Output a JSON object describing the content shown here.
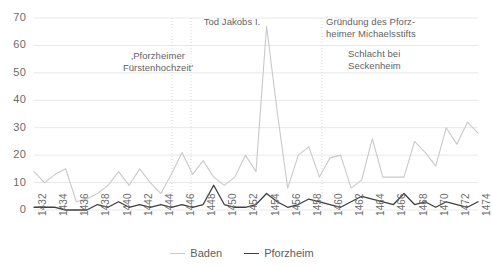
{
  "chart_data": {
    "type": "line",
    "title": "",
    "xlabel": "",
    "ylabel": "",
    "ylim": [
      0,
      70
    ],
    "y_ticks": [
      0,
      10,
      20,
      30,
      40,
      50,
      60,
      70
    ],
    "grid": "horizontal",
    "legend_position": "bottom",
    "x": [
      1432,
      1433,
      1434,
      1435,
      1436,
      1437,
      1438,
      1439,
      1440,
      1441,
      1442,
      1443,
      1444,
      1445,
      1446,
      1447,
      1448,
      1449,
      1450,
      1451,
      1452,
      1453,
      1454,
      1455,
      1456,
      1457,
      1458,
      1459,
      1460,
      1461,
      1462,
      1463,
      1464,
      1465,
      1466,
      1467,
      1468,
      1469,
      1470,
      1471,
      1472,
      1473,
      1474
    ],
    "x_tick_labels": [
      "1432",
      "1434",
      "1436",
      "1438",
      "1440",
      "1442",
      "1444",
      "1446",
      "1448",
      "1450",
      "1452",
      "1454",
      "1456",
      "1458",
      "1460",
      "1462",
      "1464",
      "1466",
      "1468",
      "1470",
      "1472",
      "1474"
    ],
    "series": [
      {
        "name": "Baden",
        "color": "#c9c9c9",
        "values": [
          14,
          10,
          13,
          15,
          3,
          4,
          6,
          9,
          14,
          9,
          15,
          10,
          6,
          13,
          21,
          13,
          18,
          12,
          9,
          12,
          20,
          14,
          67,
          36,
          8,
          20,
          23,
          12,
          19,
          20,
          8,
          11,
          26,
          12,
          12,
          12,
          25,
          21,
          16,
          30,
          24,
          32,
          28
        ]
      },
      {
        "name": "Pforzheim",
        "color": "#3f3f3f",
        "values": [
          1,
          1,
          1,
          0,
          0,
          0,
          2,
          1,
          3,
          1,
          2,
          1,
          2,
          1,
          2,
          1,
          2,
          9,
          2,
          1,
          1,
          2,
          6,
          3,
          1,
          2,
          4,
          3,
          2,
          1,
          3,
          5,
          4,
          3,
          2,
          6,
          2,
          3,
          1,
          3,
          2,
          1,
          3
        ]
      }
    ],
    "annotations": [
      {
        "id": "pforzheimer-fuerstenhochzeit",
        "text": "‚Pforzheimer\nFürstenhochzeit'",
        "left": 118,
        "top": 50,
        "width": 80,
        "align": "center",
        "marker_x": 172
      },
      {
        "id": "tod-jakobs",
        "text": "Tod Jakobs I.",
        "left": 196,
        "top": 16,
        "width": 72,
        "align": "center",
        "marker_x": 191
      },
      {
        "id": "gruendung-michaelsstift",
        "text": "Gründung des Pforz-\nheimer Michaelsstifts",
        "left": 326,
        "top": 16,
        "width": 100,
        "align": "left",
        "marker_x": 322
      },
      {
        "id": "schlacht-seckenheim",
        "text": "Schlacht bei\nSeckenheim",
        "left": 348,
        "top": 48,
        "width": 80,
        "align": "left",
        "marker_x": 322
      }
    ]
  },
  "legend": {
    "entries": [
      {
        "label": "Baden",
        "color": "#c9c9c9"
      },
      {
        "label": "Pforzheim",
        "color": "#3f3f3f"
      }
    ]
  },
  "colors": {
    "baden": "#c9c9c9",
    "pforzheim": "#3f3f3f",
    "gridline": "#e8e8e8",
    "annotation_rule": "#d8d8d8",
    "tick_text": "#6b6b6b"
  }
}
